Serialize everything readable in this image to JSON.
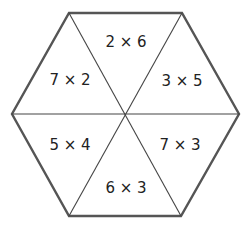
{
  "diagram": {
    "type": "hexagon-multiplication-wheel",
    "colors": {
      "outline": "#555555",
      "divider": "#444444",
      "text": "#222222",
      "background": "#ffffff"
    },
    "segments": [
      {
        "position": "top",
        "label": "2 × 6"
      },
      {
        "position": "upper-right",
        "label": "3 × 5"
      },
      {
        "position": "lower-right",
        "label": "7 × 3"
      },
      {
        "position": "bottom",
        "label": "6 × 3"
      },
      {
        "position": "lower-left",
        "label": "5 × 4"
      },
      {
        "position": "upper-left",
        "label": "7 × 2"
      }
    ]
  }
}
